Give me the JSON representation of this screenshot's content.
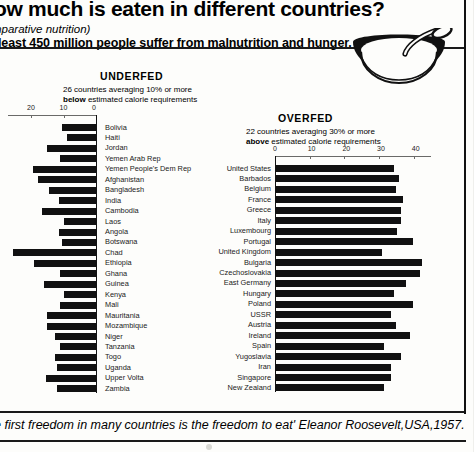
{
  "header": {
    "title": "ow much is eaten in different countries?",
    "subtitle": "mparative nutrition)",
    "lede": "least 450 million people suffer from malnutrition and hunger.",
    "illustration": "bowl-with-spoon-icon"
  },
  "quote": "e first freedom in many countries is the freedom to eat' Eleanor Roosevelt,USA,1957.",
  "chart_data": [
    {
      "id": "underfed",
      "type": "bar",
      "orientation": "horizontal-reversed",
      "title": "UNDERFED",
      "subtitle_line1": "26 countries averaging 10% or more",
      "subtitle_line2_bold": "below",
      "subtitle_line2_rest": " estimated calorie requirements",
      "xlabel": "",
      "ylabel": "",
      "xlim": [
        0,
        27
      ],
      "ticks": [
        20,
        10,
        0
      ],
      "grid": false,
      "categories": [
        "Bolivia",
        "Haiti",
        "Jordan",
        "Yemen Arab Rep",
        "Yemen People's Dem  Rep",
        "Afghanistan",
        "Bangladesh",
        "India",
        "Cambodia",
        "Laos",
        "Angola",
        "Botswana",
        "Chad",
        "Ethiopia",
        "Ghana",
        "Guinea",
        "Kenya",
        "Mali",
        "Mauritania",
        "Mozambique",
        "Niger",
        "Tanzania",
        "Togo",
        "Uganda",
        "Upper Volta",
        "Zambia"
      ],
      "values": [
        10.5,
        9.0,
        15.0,
        11.0,
        19.5,
        18.0,
        14.5,
        11.5,
        16.5,
        10.0,
        11.5,
        10.5,
        25.5,
        19.0,
        11.0,
        16.0,
        10.0,
        11.0,
        15.0,
        15.0,
        12.5,
        11.0,
        12.5,
        12.0,
        15.5,
        12.0
      ]
    },
    {
      "id": "overfed",
      "type": "bar",
      "orientation": "horizontal",
      "title": "OVERFED",
      "subtitle_line1": "22 countries averaging 30% or more",
      "subtitle_line2_bold": "above",
      "subtitle_line2_rest": " estimated calorie requirements",
      "xlabel": "",
      "ylabel": "",
      "xlim": [
        0,
        45
      ],
      "ticks": [
        0,
        10,
        20,
        30,
        40
      ],
      "grid": false,
      "categories": [
        "United States",
        "Barbados",
        "Belgium",
        "France",
        "Greece",
        "Italy",
        "Luxembourg",
        "Portugal",
        "United Kingdom",
        "Bulgaria",
        "Czechoslovakia",
        "East Germany",
        "Hungary",
        "Poland",
        "USSR",
        "Austria",
        "Ireland",
        "Spain",
        "Yugoslavia",
        "Iran",
        "Singapore",
        "New Zealand"
      ],
      "values": [
        34.0,
        35.5,
        34.5,
        36.5,
        36.0,
        36.0,
        35.0,
        39.5,
        30.5,
        42.0,
        41.5,
        37.5,
        34.0,
        39.5,
        33.0,
        34.5,
        38.5,
        31.0,
        36.0,
        33.0,
        33.0,
        31.0
      ]
    }
  ]
}
